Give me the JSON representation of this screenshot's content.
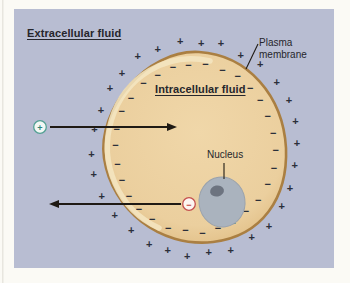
{
  "figure": {
    "region_labels": {
      "extracellular": "Extracellular fluid",
      "intracellular": "Intracellular fluid",
      "plasma_membrane": "Plasma membrane",
      "nucleus": "Nucleus"
    },
    "ion_icons": {
      "plus_symbol": "+",
      "minus_symbol": "−"
    },
    "membrane_charges": {
      "outer_symbol": "+",
      "inner_symbol": "−",
      "pair_count": 30
    },
    "colors": {
      "page_bg": "#fbfaf5",
      "page_edge_line": "#e8e6df",
      "panel_bg": "#b8bdd2",
      "cell_fill_light": "#f0d7a9",
      "cell_fill": "#ebcf9e",
      "cell_edge": "#ddb87c",
      "cell_highlight": "#f4e6c2",
      "membrane_stroke": "#aa7f42",
      "nucleus_fill": "#aab3be",
      "nucleus_stroke": "#99a2ad",
      "nucleolus_fill": "#6d7480",
      "charge_color": "#2b2f3a",
      "text_color": "#26262c",
      "arrow_color": "#1f1a14",
      "plus_icon_color": "#2f8377",
      "plus_icon_border": "#52a093",
      "plus_icon_bg": "#f2f8f4",
      "minus_icon_color": "#bf3b3b",
      "minus_icon_border": "#c4504e",
      "minus_icon_bg": "#fdf5f1"
    }
  }
}
